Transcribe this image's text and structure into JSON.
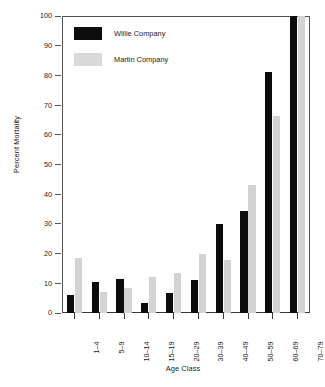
{
  "chart_data": {
    "type": "bar",
    "title": "",
    "xlabel": "Age Class",
    "ylabel": "Percent Mortality",
    "categories": [
      "1–4",
      "5–9",
      "10–14",
      "15–19",
      "20–29",
      "30–39",
      "40–49",
      "50–59",
      "60–69",
      "70–79"
    ],
    "series": [
      {
        "name": "Willie Company",
        "color": "#0c0c0c",
        "values": [
          6,
          10.3,
          11.3,
          3.5,
          6.8,
          11,
          30,
          34.5,
          81,
          100
        ]
      },
      {
        "name": "Martin Company",
        "color": "#d3d3d3",
        "values": [
          18.5,
          7,
          8.5,
          12,
          13.5,
          20,
          18,
          43,
          66.5,
          100
        ]
      }
    ],
    "ylim": [
      0,
      100
    ],
    "yticks": [
      0,
      10,
      20,
      30,
      40,
      50,
      60,
      70,
      80,
      90,
      100
    ],
    "ytick_labels": [
      "0",
      "10",
      "20",
      "30",
      "40",
      "50",
      "60",
      "70",
      "80",
      "90",
      "100"
    ],
    "grid": false,
    "legend_position": "top-left"
  }
}
